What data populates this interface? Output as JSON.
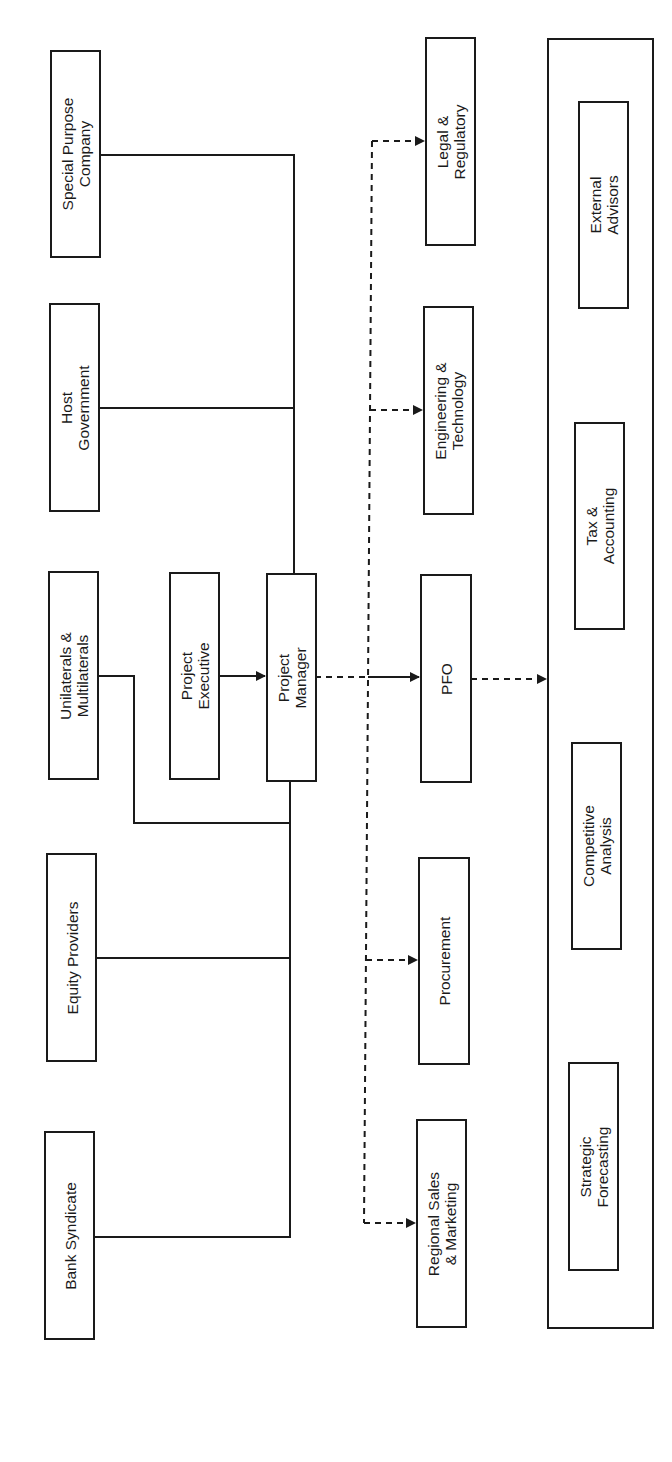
{
  "diagram": {
    "orientation": "rotated-90-ccw",
    "stakeholders": [
      {
        "id": "special-purpose-company",
        "label": "Special Purpose\nCompany"
      },
      {
        "id": "host-government",
        "label": "Host\nGovernment"
      },
      {
        "id": "unilaterals-multilaterals",
        "label": "Unilaterals &\nMultilaterals"
      },
      {
        "id": "equity-providers",
        "label": "Equity Providers"
      },
      {
        "id": "bank-syndicate",
        "label": "Bank Syndicate"
      }
    ],
    "core": {
      "project_executive": {
        "label": "Project\nExecutive"
      },
      "project_manager": {
        "label": "Project\nManager"
      }
    },
    "functions": [
      {
        "id": "legal-regulatory",
        "label": "Legal &\nRegulatory"
      },
      {
        "id": "engineering-technology",
        "label": "Engineering &\nTechnology"
      },
      {
        "id": "pfo",
        "label": "PFO"
      },
      {
        "id": "procurement",
        "label": "Procurement"
      },
      {
        "id": "regional-sales-marketing",
        "label": "Regional Sales\n& Marketing"
      }
    ],
    "advisory_group": {
      "members": [
        {
          "id": "external-advisors",
          "label": "External\nAdvisors"
        },
        {
          "id": "tax-accounting",
          "label": "Tax &\nAccounting"
        },
        {
          "id": "competitive-analysis",
          "label": "Competitive\nAnalysis"
        },
        {
          "id": "strategic-forecasting",
          "label": "Strategic\nForecasting"
        }
      ]
    },
    "edges": [
      {
        "from": "Special Purpose Company",
        "to": "Project Manager",
        "style": "solid"
      },
      {
        "from": "Host Government",
        "to": "Project Manager",
        "style": "solid"
      },
      {
        "from": "Unilaterals & Multilaterals",
        "to": "Project Manager",
        "style": "solid"
      },
      {
        "from": "Equity Providers",
        "to": "Project Manager",
        "style": "solid"
      },
      {
        "from": "Bank Syndicate",
        "to": "Project Manager",
        "style": "solid"
      },
      {
        "from": "Project Executive",
        "to": "Project Manager",
        "style": "solid-arrow"
      },
      {
        "from": "Project Manager",
        "to": "PFO",
        "style": "dashed-then-solid-arrow"
      },
      {
        "from": "Project Manager",
        "to": "Legal & Regulatory",
        "style": "dashed-arrow"
      },
      {
        "from": "Project Manager",
        "to": "Engineering & Technology",
        "style": "dashed-arrow"
      },
      {
        "from": "Project Manager",
        "to": "Procurement",
        "style": "dashed-arrow"
      },
      {
        "from": "Project Manager",
        "to": "Regional Sales & Marketing",
        "style": "dashed-arrow"
      },
      {
        "from": "PFO",
        "to": "Advisory Group",
        "style": "dashed-arrow"
      }
    ],
    "colors": {
      "line": "#1a1a1a",
      "background": "#ffffff"
    }
  }
}
